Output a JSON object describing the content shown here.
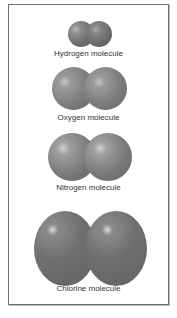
{
  "figure": {
    "molecules": [
      {
        "name": "hydrogen",
        "label": "Hydrogen molecule"
      },
      {
        "name": "oxygen",
        "label": "Oxygen molecule"
      },
      {
        "name": "nitrogen",
        "label": "Nitrogen molecule"
      },
      {
        "name": "chlorine",
        "label": "Chlorine molecule"
      }
    ],
    "colors": {
      "sphere": "#6f6f6f",
      "highlight": "#e0e0e0",
      "frame": "#6e6e6e",
      "text": "#333333"
    }
  }
}
